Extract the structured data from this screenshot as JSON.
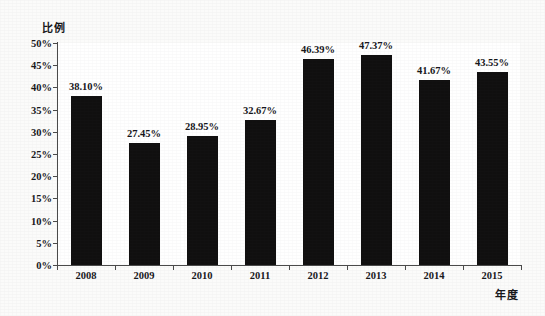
{
  "chart_data": {
    "type": "bar",
    "title": "",
    "subtitle": "",
    "xlabel": "年度",
    "ylabel": "比例",
    "categories": [
      "2008",
      "2009",
      "2010",
      "2011",
      "2012",
      "2013",
      "2014",
      "2015"
    ],
    "values": [
      38.1,
      27.45,
      28.95,
      32.67,
      46.39,
      47.37,
      41.67,
      43.55
    ],
    "value_labels": [
      "38.10%",
      "27.45%",
      "28.95%",
      "32.67%",
      "46.39%",
      "47.37%",
      "41.67%",
      "43.55%"
    ],
    "ylim": [
      0,
      50
    ],
    "ytick_step": 5,
    "ytick_labels": [
      "0%",
      "5%",
      "10%",
      "15%",
      "20%",
      "25%",
      "30%",
      "35%",
      "40%",
      "45%",
      "50%"
    ],
    "ytick_values": [
      0,
      5,
      10,
      15,
      20,
      25,
      30,
      35,
      40,
      45,
      50
    ],
    "grid": false,
    "legend": null,
    "legend_position": "none",
    "series": [
      {
        "name": "比例",
        "values": [
          38.1,
          27.45,
          28.95,
          32.67,
          46.39,
          47.37,
          41.67,
          43.55
        ]
      }
    ],
    "colors": {
      "bar": "#100f0f",
      "axis": "#4a4a4a",
      "text": "#18181b",
      "background": "#fbfbfa",
      "plot_background": "#ffffff"
    }
  }
}
